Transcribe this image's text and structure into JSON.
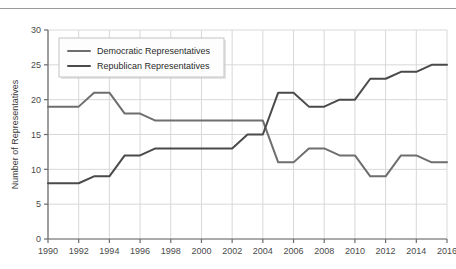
{
  "chart_data": {
    "type": "line",
    "title": "",
    "xlabel": "",
    "ylabel": "Number of Representatives",
    "xlim": [
      1990,
      2016
    ],
    "ylim": [
      0,
      30
    ],
    "ytick_step": 5,
    "xtick_step": 2,
    "grid": true,
    "legend_position": "top-left",
    "yticks": [
      0,
      5,
      10,
      15,
      20,
      25,
      30
    ],
    "xticks": [
      1990,
      1992,
      1994,
      1996,
      1998,
      2000,
      2002,
      2004,
      2006,
      2008,
      2010,
      2012,
      2014,
      2016
    ],
    "x": [
      1990,
      1991,
      1992,
      1993,
      1994,
      1995,
      1996,
      1997,
      1998,
      1999,
      2000,
      2001,
      2002,
      2003,
      2004,
      2005,
      2006,
      2007,
      2008,
      2009,
      2010,
      2011,
      2012,
      2013,
      2014,
      2015,
      2016
    ],
    "series": [
      {
        "name": "Democratic Representatives",
        "color": "#6e6e6e",
        "values": [
          19,
          19,
          19,
          21,
          21,
          18,
          18,
          17,
          17,
          17,
          17,
          17,
          17,
          17,
          17,
          11,
          11,
          13,
          13,
          12,
          12,
          9,
          9,
          12,
          12,
          11,
          11
        ]
      },
      {
        "name": "Republican Representatives",
        "color": "#4a4a4a",
        "values": [
          8,
          8,
          8,
          9,
          9,
          12,
          12,
          13,
          13,
          13,
          13,
          13,
          13,
          15,
          15,
          21,
          21,
          19,
          19,
          20,
          20,
          23,
          23,
          24,
          24,
          25,
          25
        ]
      }
    ]
  },
  "legend": {
    "entries": [
      {
        "label": "Democratic Representatives",
        "color": "#6e6e6e"
      },
      {
        "label": "Republican Representatives",
        "color": "#4a4a4a"
      }
    ]
  },
  "axes": {
    "y_title": "Number of Representatives"
  }
}
